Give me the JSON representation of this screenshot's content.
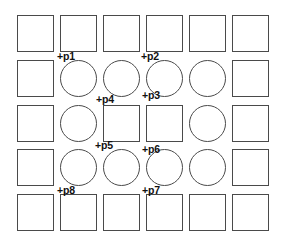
{
  "diagram": {
    "title": "",
    "stroke_color": "#4a4a4a",
    "label_color": "#111111",
    "background": "#ffffff",
    "grid": {
      "rows": 5,
      "cols": 6,
      "origin_x": 17,
      "origin_y": 15,
      "step_x": 43,
      "step_y": 44.75,
      "cell_w": 37,
      "cell_h": 37,
      "layout": [
        [
          "square",
          "square",
          "square",
          "square",
          "square",
          "square"
        ],
        [
          "square",
          "circle",
          "circle",
          "circle",
          "circle",
          "square"
        ],
        [
          "square",
          "circle",
          "square",
          "square",
          "circle",
          "square"
        ],
        [
          "square",
          "circle",
          "circle",
          "circle",
          "circle",
          "square"
        ],
        [
          "square",
          "square",
          "square",
          "square",
          "square",
          "square"
        ]
      ]
    },
    "points": [
      {
        "id": "p1",
        "text": "+p1",
        "x": 57,
        "y": 51
      },
      {
        "id": "p2",
        "text": "+p2",
        "x": 141,
        "y": 51
      },
      {
        "id": "p3",
        "text": "+p3",
        "x": 142,
        "y": 90
      },
      {
        "id": "p4",
        "text": "+p4",
        "x": 96,
        "y": 94
      },
      {
        "id": "p5",
        "text": "+p5",
        "x": 95,
        "y": 140
      },
      {
        "id": "p6",
        "text": "+p6",
        "x": 142,
        "y": 144
      },
      {
        "id": "p7",
        "text": "+p7",
        "x": 142,
        "y": 185
      },
      {
        "id": "p8",
        "text": "+p8",
        "x": 57,
        "y": 185
      }
    ]
  }
}
